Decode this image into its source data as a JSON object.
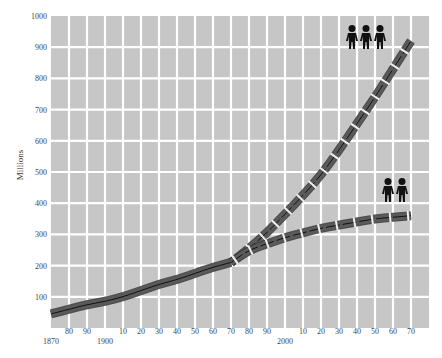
{
  "chart_data": {
    "type": "line",
    "title": "",
    "xlabel": "",
    "ylabel": "Millions",
    "ylim": [
      0,
      1000
    ],
    "xlim": [
      1870,
      2080
    ],
    "grid": true,
    "y_ticks": [
      100,
      200,
      300,
      400,
      500,
      600,
      700,
      800,
      900,
      1000
    ],
    "x_ticks": [
      {
        "year": 1870,
        "label": "1870",
        "row": 2
      },
      {
        "year": 1880,
        "label": "80",
        "row": 1
      },
      {
        "year": 1890,
        "label": "90",
        "row": 1
      },
      {
        "year": 1900,
        "label": "1900",
        "row": 2
      },
      {
        "year": 1910,
        "label": "10",
        "row": 1
      },
      {
        "year": 1920,
        "label": "20",
        "row": 1
      },
      {
        "year": 1930,
        "label": "30",
        "row": 1
      },
      {
        "year": 1940,
        "label": "40",
        "row": 1
      },
      {
        "year": 1950,
        "label": "50",
        "row": 1
      },
      {
        "year": 1960,
        "label": "60",
        "row": 1
      },
      {
        "year": 1970,
        "label": "70",
        "row": 1
      },
      {
        "year": 1980,
        "label": "80",
        "row": 1
      },
      {
        "year": 1990,
        "label": "90",
        "row": 1
      },
      {
        "year": 2000,
        "label": "2000",
        "row": 2
      },
      {
        "year": 2010,
        "label": "10",
        "row": 1
      },
      {
        "year": 2020,
        "label": "20",
        "row": 1
      },
      {
        "year": 2030,
        "label": "30",
        "row": 1
      },
      {
        "year": 2040,
        "label": "40",
        "row": 1
      },
      {
        "year": 2050,
        "label": "50",
        "row": 1
      },
      {
        "year": 2060,
        "label": "60",
        "row": 1
      },
      {
        "year": 2070,
        "label": "70",
        "row": 1
      }
    ],
    "series": [
      {
        "name": "Historical",
        "style": "solid",
        "x": [
          1870,
          1880,
          1890,
          1900,
          1910,
          1920,
          1930,
          1940,
          1950,
          1960,
          1970
        ],
        "values": [
          45,
          60,
          75,
          85,
          100,
          120,
          140,
          155,
          175,
          195,
          210
        ]
      },
      {
        "name": "High projection (three-person icon)",
        "style": "dashed",
        "icon": "three-people",
        "x": [
          1970,
          1980,
          1990,
          2000,
          2010,
          2020,
          2030,
          2040,
          2050,
          2060,
          2070
        ],
        "values": [
          210,
          255,
          305,
          365,
          425,
          490,
          570,
          655,
          740,
          830,
          920
        ]
      },
      {
        "name": "Low projection (two-person icon)",
        "style": "dashed",
        "icon": "two-people",
        "x": [
          1970,
          1980,
          1990,
          2000,
          2010,
          2020,
          2030,
          2040,
          2050,
          2060,
          2070
        ],
        "values": [
          210,
          250,
          270,
          290,
          305,
          320,
          330,
          340,
          350,
          355,
          360
        ]
      }
    ],
    "annotations": [
      {
        "type": "icon",
        "name": "three-people",
        "near": {
          "year": 2045,
          "value": 960
        }
      },
      {
        "type": "icon",
        "name": "two-people",
        "near": {
          "year": 2055,
          "value": 410
        }
      }
    ]
  },
  "colors": {
    "cell": "#c6c6c6",
    "gutter": "#ffffff",
    "band": "#5a5a5a",
    "band_edge": "#3a3a3a",
    "center_line": "#111111",
    "icon": "#111111"
  }
}
